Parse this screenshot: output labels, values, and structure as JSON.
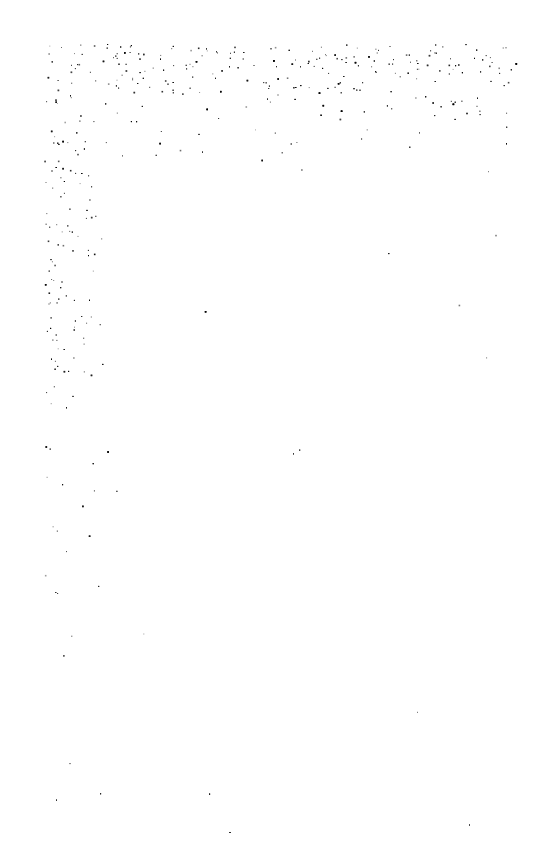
{
  "page": {
    "type": "blank scanned page",
    "text": "",
    "background_color": "#ffffff",
    "noise_color": "#000000"
  }
}
